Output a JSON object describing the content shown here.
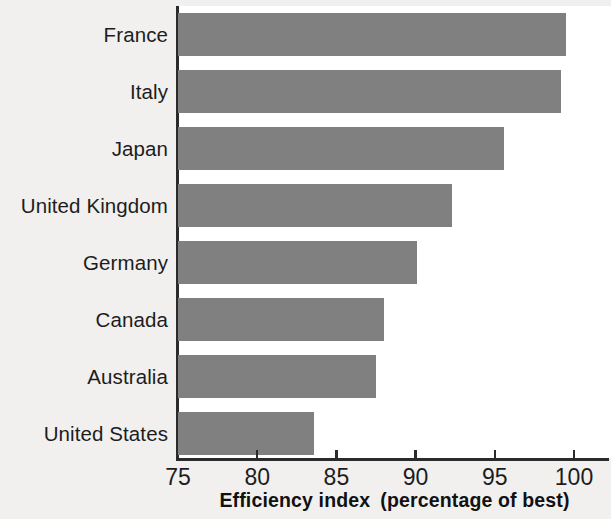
{
  "chart_data": {
    "type": "bar",
    "orientation": "horizontal",
    "title": "",
    "xlabel": "Efficiency index  (percentage of best)",
    "xlabel_main": "Efficiency index",
    "xlabel_paren": "(percentage of best)",
    "ylabel": "",
    "categories": [
      "France",
      "Italy",
      "Japan",
      "United Kingdom",
      "Germany",
      "Canada",
      "Australia",
      "United States"
    ],
    "values": [
      99.5,
      99.2,
      95.6,
      92.3,
      90.1,
      88.0,
      87.5,
      83.6
    ],
    "xlim": [
      75,
      101.5
    ],
    "xticks": [
      75,
      80,
      85,
      90,
      95,
      100
    ],
    "xtick_labels": [
      "75",
      "80",
      "85",
      "90",
      "95",
      "100"
    ],
    "grid": false,
    "legend": null,
    "bar_color": "#808080",
    "axis_color": "#2b2b2b",
    "plot_background": "#ffffff",
    "figure_background": "#f1f0ee"
  }
}
